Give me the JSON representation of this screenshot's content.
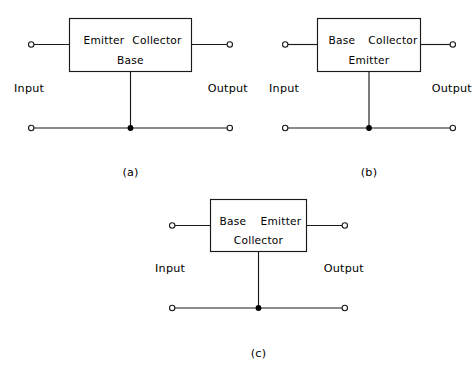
{
  "figure": {
    "top_edge_artifact": "",
    "terminal_labels": {
      "input": "Input",
      "output": "Output"
    },
    "diagrams": [
      {
        "id": "a",
        "caption": "(a)",
        "configuration": "common-base",
        "box_labels": {
          "top_left": "Emitter",
          "top_right": "Collector",
          "bottom_center": "Base"
        },
        "input_label": "Input",
        "output_label": "Output"
      },
      {
        "id": "b",
        "caption": "(b)",
        "configuration": "common-emitter",
        "box_labels": {
          "top_left": "Base",
          "top_right": "Collector",
          "bottom_center": "Emitter"
        },
        "input_label": "Input",
        "output_label": "Output"
      },
      {
        "id": "c",
        "caption": "(c)",
        "configuration": "common-collector",
        "box_labels": {
          "top_left": "Base",
          "top_right": "Emitter",
          "bottom_center": "Collector"
        },
        "input_label": "Input",
        "output_label": "Output"
      }
    ]
  }
}
